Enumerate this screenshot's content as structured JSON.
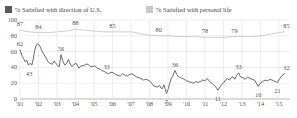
{
  "legend": {
    "items": [
      {
        "label": "% Satisfied with direction of U.S.",
        "color": "#595959",
        "name": "legend-item-us"
      },
      {
        "label": "% Satisfied with personal life",
        "color": "#c9c9c9",
        "name": "legend-item-personal"
      }
    ]
  },
  "axis": {
    "y_ticks": [
      "100",
      "80",
      "60",
      "40",
      "20",
      "0"
    ],
    "x_ticks": [
      "'01",
      "'02",
      "'03",
      "'04",
      "'05",
      "'06",
      "'07",
      "'08",
      "'09",
      "'10",
      "'11",
      "'12",
      "'13",
      "'14",
      "'15"
    ]
  },
  "chart_data": {
    "type": "line",
    "title": "",
    "subtitle": "",
    "xlabel": "",
    "ylabel": "",
    "ylim": [
      0,
      100
    ],
    "xlim": [
      2001,
      2015.6
    ],
    "grid": true,
    "legend_position": "top-left",
    "series": [
      {
        "name": "% Satisfied with direction of U.S.",
        "color": "#595959",
        "points": [
          [
            2001.0,
            62
          ],
          [
            2001.12,
            54
          ],
          [
            2001.2,
            51
          ],
          [
            2001.28,
            47
          ],
          [
            2001.36,
            49
          ],
          [
            2001.45,
            43
          ],
          [
            2001.55,
            45
          ],
          [
            2001.64,
            43
          ],
          [
            2001.72,
            51
          ],
          [
            2001.78,
            60
          ],
          [
            2001.86,
            67
          ],
          [
            2001.95,
            70
          ],
          [
            2002.05,
            68
          ],
          [
            2002.15,
            63
          ],
          [
            2002.25,
            58
          ],
          [
            2002.35,
            54
          ],
          [
            2002.45,
            50
          ],
          [
            2002.55,
            46
          ],
          [
            2002.65,
            45
          ],
          [
            2002.75,
            44
          ],
          [
            2002.85,
            48
          ],
          [
            2002.95,
            45
          ],
          [
            2003.05,
            42
          ],
          [
            2003.12,
            41
          ],
          [
            2003.22,
            56
          ],
          [
            2003.32,
            48
          ],
          [
            2003.42,
            43
          ],
          [
            2003.52,
            45
          ],
          [
            2003.62,
            50
          ],
          [
            2003.72,
            44
          ],
          [
            2003.82,
            41
          ],
          [
            2003.92,
            44
          ],
          [
            2004.05,
            45
          ],
          [
            2004.18,
            39
          ],
          [
            2004.3,
            42
          ],
          [
            2004.42,
            42
          ],
          [
            2004.55,
            44
          ],
          [
            2004.68,
            44
          ],
          [
            2004.8,
            41
          ],
          [
            2004.92,
            41
          ],
          [
            2005.05,
            42
          ],
          [
            2005.18,
            39
          ],
          [
            2005.3,
            38
          ],
          [
            2005.42,
            36
          ],
          [
            2005.55,
            35
          ],
          [
            2005.68,
            33
          ],
          [
            2005.8,
            32
          ],
          [
            2005.92,
            34
          ],
          [
            2006.05,
            33
          ],
          [
            2006.18,
            31
          ],
          [
            2006.3,
            30
          ],
          [
            2006.42,
            29
          ],
          [
            2006.55,
            32
          ],
          [
            2006.68,
            30
          ],
          [
            2006.8,
            29
          ],
          [
            2006.92,
            31
          ],
          [
            2007.05,
            32
          ],
          [
            2007.18,
            30
          ],
          [
            2007.3,
            28
          ],
          [
            2007.42,
            27
          ],
          [
            2007.55,
            26
          ],
          [
            2007.68,
            24
          ],
          [
            2007.8,
            25
          ],
          [
            2007.92,
            24
          ],
          [
            2008.05,
            22
          ],
          [
            2008.18,
            18
          ],
          [
            2008.3,
            16
          ],
          [
            2008.42,
            15
          ],
          [
            2008.55,
            17
          ],
          [
            2008.62,
            14
          ],
          [
            2008.7,
            13
          ],
          [
            2008.78,
            18
          ],
          [
            2008.86,
            12
          ],
          [
            2008.92,
            7
          ],
          [
            2009.02,
            13
          ],
          [
            2009.1,
            20
          ],
          [
            2009.18,
            26
          ],
          [
            2009.28,
            30
          ],
          [
            2009.38,
            36
          ],
          [
            2009.48,
            31
          ],
          [
            2009.58,
            28
          ],
          [
            2009.68,
            27
          ],
          [
            2009.78,
            26
          ],
          [
            2009.88,
            25
          ],
          [
            2010.0,
            23
          ],
          [
            2010.12,
            22
          ],
          [
            2010.25,
            21
          ],
          [
            2010.38,
            20
          ],
          [
            2010.5,
            22
          ],
          [
            2010.62,
            21
          ],
          [
            2010.75,
            22
          ],
          [
            2010.88,
            24
          ],
          [
            2011.0,
            23
          ],
          [
            2011.12,
            26
          ],
          [
            2011.25,
            22
          ],
          [
            2011.38,
            20
          ],
          [
            2011.5,
            17
          ],
          [
            2011.6,
            15
          ],
          [
            2011.7,
            11
          ],
          [
            2011.8,
            15
          ],
          [
            2011.9,
            18
          ],
          [
            2012.02,
            21
          ],
          [
            2012.12,
            24
          ],
          [
            2012.22,
            26
          ],
          [
            2012.32,
            24
          ],
          [
            2012.42,
            27
          ],
          [
            2012.52,
            28
          ],
          [
            2012.62,
            25
          ],
          [
            2012.72,
            30
          ],
          [
            2012.82,
            33
          ],
          [
            2012.92,
            28
          ],
          [
            2013.05,
            27
          ],
          [
            2013.18,
            25
          ],
          [
            2013.3,
            28
          ],
          [
            2013.42,
            26
          ],
          [
            2013.55,
            25
          ],
          [
            2013.68,
            24
          ],
          [
            2013.78,
            20
          ],
          [
            2013.88,
            16
          ],
          [
            2014.0,
            20
          ],
          [
            2014.12,
            22
          ],
          [
            2014.25,
            24
          ],
          [
            2014.38,
            23
          ],
          [
            2014.5,
            25
          ],
          [
            2014.62,
            24
          ],
          [
            2014.72,
            23
          ],
          [
            2014.82,
            22
          ],
          [
            2014.92,
            21
          ],
          [
            2015.05,
            26
          ],
          [
            2015.18,
            30
          ],
          [
            2015.3,
            32
          ]
        ],
        "labeled_points": [
          {
            "x": 2001.0,
            "y": 62,
            "value": "62",
            "dx": 0,
            "dy": -7
          },
          {
            "x": 2001.5,
            "y": 43,
            "value": "43",
            "dx": 0,
            "dy": 8
          },
          {
            "x": 2003.22,
            "y": 56,
            "value": "56",
            "dx": 0,
            "dy": -7
          },
          {
            "x": 2005.68,
            "y": 33,
            "value": "33",
            "dx": 0,
            "dy": -7
          },
          {
            "x": 2008.92,
            "y": 7,
            "value": "7",
            "dx": 0,
            "dy": 8
          },
          {
            "x": 2009.38,
            "y": 36,
            "value": "36",
            "dx": 0,
            "dy": -7
          },
          {
            "x": 2011.7,
            "y": 11,
            "value": "11",
            "dx": 0,
            "dy": 8
          },
          {
            "x": 2012.82,
            "y": 33,
            "value": "33",
            "dx": 0,
            "dy": -7
          },
          {
            "x": 2013.88,
            "y": 16,
            "value": "16",
            "dx": 0,
            "dy": 8
          },
          {
            "x": 2014.92,
            "y": 21,
            "value": "21",
            "dx": 0,
            "dy": 8
          },
          {
            "x": 2015.3,
            "y": 32,
            "value": "32",
            "dx": 2,
            "dy": -7
          }
        ]
      },
      {
        "name": "% Satisfied with personal life",
        "color": "#c9c9c9",
        "points": [
          [
            2001.0,
            87
          ],
          [
            2001.5,
            85
          ],
          [
            2002.0,
            84
          ],
          [
            2002.5,
            84
          ],
          [
            2003.0,
            85
          ],
          [
            2003.5,
            86
          ],
          [
            2004.0,
            88
          ],
          [
            2004.5,
            87
          ],
          [
            2005.0,
            86
          ],
          [
            2005.5,
            85
          ],
          [
            2006.0,
            85
          ],
          [
            2006.5,
            85
          ],
          [
            2007.0,
            85
          ],
          [
            2007.3,
            84
          ],
          [
            2007.6,
            82
          ],
          [
            2008.0,
            81
          ],
          [
            2008.5,
            80
          ],
          [
            2009.0,
            80
          ],
          [
            2009.5,
            79
          ],
          [
            2010.0,
            79
          ],
          [
            2010.5,
            79
          ],
          [
            2011.0,
            78
          ],
          [
            2011.5,
            78
          ],
          [
            2012.0,
            78
          ],
          [
            2012.5,
            79
          ],
          [
            2013.0,
            79
          ],
          [
            2013.5,
            79
          ],
          [
            2014.0,
            80
          ],
          [
            2014.5,
            82
          ],
          [
            2015.0,
            84
          ],
          [
            2015.3,
            85
          ]
        ],
        "labeled_points": [
          {
            "x": 2001.0,
            "y": 87,
            "value": "87",
            "dx": 0,
            "dy": -7
          },
          {
            "x": 2002.0,
            "y": 84,
            "value": "84",
            "dx": 0,
            "dy": -7
          },
          {
            "x": 2004.0,
            "y": 88,
            "value": "88",
            "dx": 0,
            "dy": -7
          },
          {
            "x": 2006.0,
            "y": 85,
            "value": "85",
            "dx": 0,
            "dy": -7
          },
          {
            "x": 2008.5,
            "y": 80,
            "value": "80",
            "dx": 0,
            "dy": -7
          },
          {
            "x": 2011.0,
            "y": 78,
            "value": "78",
            "dx": 0,
            "dy": -7
          },
          {
            "x": 2012.6,
            "y": 79,
            "value": "79",
            "dx": 0,
            "dy": -7
          },
          {
            "x": 2015.3,
            "y": 85,
            "value": "85",
            "dx": 2,
            "dy": -7
          }
        ]
      }
    ]
  }
}
